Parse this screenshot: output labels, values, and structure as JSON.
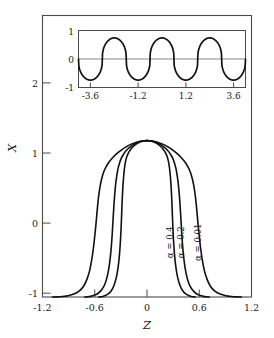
{
  "figure": {
    "name": "soliton-lattice-profile-figure",
    "background_color": "#ffffff",
    "line_color": "#111111",
    "frame_color": "#4a4a4a"
  },
  "chart_data": {
    "type": "line",
    "title": "",
    "xlabel": "Z",
    "ylabel": "X",
    "xlim": [
      -1.2,
      1.2
    ],
    "ylim": [
      -1.0,
      2.6
    ],
    "grid": false,
    "legend": "inline-curve-labels",
    "x_ticks": [
      -1.2,
      -0.6,
      0,
      0.6,
      1.2
    ],
    "x_tick_labels": [
      "-1.2",
      "-0.6",
      "0",
      "0.6",
      "1.2"
    ],
    "y_ticks": [
      -1,
      0,
      1,
      2
    ],
    "y_tick_labels": [
      "-1",
      "0",
      "1",
      "2"
    ],
    "series": [
      {
        "name": "alpha-0.4",
        "label": "α = 0.4",
        "alpha": 0.4,
        "label_position": {
          "z": 0.3,
          "x": -0.3
        },
        "half_width_at_x0": 0.3,
        "tail_end_z": 0.52,
        "points": [
          [
            0.0,
            1.0
          ],
          [
            0.04,
            0.995
          ],
          [
            0.08,
            0.982
          ],
          [
            0.12,
            0.958
          ],
          [
            0.16,
            0.922
          ],
          [
            0.19,
            0.884
          ],
          [
            0.21,
            0.85
          ],
          [
            0.23,
            0.8
          ],
          [
            0.245,
            0.74
          ],
          [
            0.257,
            0.66
          ],
          [
            0.266,
            0.57
          ],
          [
            0.274,
            0.46
          ],
          [
            0.281,
            0.33
          ],
          [
            0.287,
            0.18
          ],
          [
            0.292,
            0.03
          ],
          [
            0.298,
            -0.13
          ],
          [
            0.306,
            -0.3
          ],
          [
            0.317,
            -0.47
          ],
          [
            0.332,
            -0.62
          ],
          [
            0.352,
            -0.75
          ],
          [
            0.378,
            -0.85
          ],
          [
            0.41,
            -0.92
          ],
          [
            0.445,
            -0.96
          ],
          [
            0.48,
            -0.982
          ],
          [
            0.51,
            -0.993
          ],
          [
            0.535,
            -0.998
          ],
          [
            0.555,
            -1.0
          ]
        ]
      },
      {
        "name": "alpha-0.2",
        "label": "α = 0.2",
        "alpha": 0.2,
        "label_position": {
          "z": 0.43,
          "x": -0.3
        },
        "half_width_at_x0": 0.4,
        "tail_end_z": 0.7,
        "points": [
          [
            0.0,
            1.0
          ],
          [
            0.05,
            0.995
          ],
          [
            0.1,
            0.98
          ],
          [
            0.15,
            0.953
          ],
          [
            0.2,
            0.912
          ],
          [
            0.24,
            0.87
          ],
          [
            0.27,
            0.826
          ],
          [
            0.295,
            0.775
          ],
          [
            0.315,
            0.715
          ],
          [
            0.332,
            0.645
          ],
          [
            0.346,
            0.56
          ],
          [
            0.358,
            0.46
          ],
          [
            0.368,
            0.35
          ],
          [
            0.377,
            0.22
          ],
          [
            0.385,
            0.08
          ],
          [
            0.393,
            -0.07
          ],
          [
            0.402,
            -0.24
          ],
          [
            0.414,
            -0.41
          ],
          [
            0.431,
            -0.58
          ],
          [
            0.453,
            -0.72
          ],
          [
            0.482,
            -0.83
          ],
          [
            0.518,
            -0.905
          ],
          [
            0.56,
            -0.952
          ],
          [
            0.605,
            -0.978
          ],
          [
            0.648,
            -0.992
          ],
          [
            0.685,
            -0.998
          ],
          [
            0.715,
            -1.0
          ]
        ]
      },
      {
        "name": "alpha-0.01",
        "label": "α = 0.01",
        "alpha": 0.01,
        "label_position": {
          "z": 0.62,
          "x": -0.3
        },
        "half_width_at_x0": 0.6,
        "tail_end_z": 1.08,
        "points": [
          [
            0.0,
            1.0
          ],
          [
            0.06,
            0.995
          ],
          [
            0.12,
            0.98
          ],
          [
            0.18,
            0.955
          ],
          [
            0.24,
            0.92
          ],
          [
            0.3,
            0.875
          ],
          [
            0.35,
            0.83
          ],
          [
            0.4,
            0.775
          ],
          [
            0.44,
            0.72
          ],
          [
            0.47,
            0.665
          ],
          [
            0.495,
            0.605
          ],
          [
            0.515,
            0.535
          ],
          [
            0.532,
            0.455
          ],
          [
            0.546,
            0.365
          ],
          [
            0.558,
            0.265
          ],
          [
            0.568,
            0.155
          ],
          [
            0.578,
            0.035
          ],
          [
            0.588,
            -0.09
          ],
          [
            0.6,
            -0.22
          ],
          [
            0.615,
            -0.37
          ],
          [
            0.634,
            -0.52
          ],
          [
            0.658,
            -0.66
          ],
          [
            0.69,
            -0.775
          ],
          [
            0.73,
            -0.865
          ],
          [
            0.78,
            -0.925
          ],
          [
            0.84,
            -0.963
          ],
          [
            0.905,
            -0.983
          ],
          [
            0.97,
            -0.993
          ],
          [
            1.03,
            -0.998
          ],
          [
            1.085,
            -1.0
          ]
        ]
      }
    ]
  },
  "inset_chart_data": {
    "type": "line",
    "title": "",
    "xlabel": "",
    "ylabel": "",
    "xlim": [
      -4.2,
      4.2
    ],
    "ylim": [
      -1.35,
      1.35
    ],
    "grid": false,
    "zero_line": true,
    "x_ticks": [
      -3.6,
      -1.2,
      1.2,
      3.6
    ],
    "x_tick_labels": [
      "-3.6",
      "-1.2",
      "1.2",
      "3.6"
    ],
    "y_ticks": [
      -1,
      0,
      1
    ],
    "y_tick_labels": [
      "1",
      "0",
      "-1"
    ],
    "waveform": "periodic soliton lattice, period 2.4, amplitude 1",
    "period": 2.4,
    "amplitude": 1,
    "minima_at": [
      -1.2,
      1.2
    ],
    "maxima_at": [
      -2.4,
      0.0,
      2.4
    ]
  },
  "labels": {
    "y_axis_title": "X",
    "x_axis_title": "Z"
  }
}
